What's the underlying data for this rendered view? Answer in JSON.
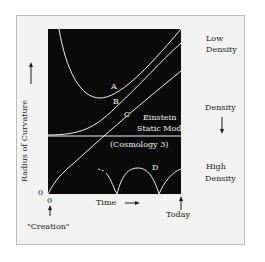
{
  "diagram": {
    "y_axis_label": "Radius of Curvature",
    "y_axis_arrow": "↑",
    "y_origin": "0",
    "x_origin": "0",
    "x_axis_label": "Time",
    "x_axis_arrow": "→",
    "creation_label": "\"Creation\"",
    "today_label": "Today",
    "right_labels": {
      "low_density": [
        "Low",
        "Density"
      ],
      "density": "Density",
      "high_density": [
        "High",
        "Density"
      ]
    },
    "curve_labels": {
      "A": "A",
      "B": "B",
      "C": "C",
      "D": "D"
    },
    "static_model": {
      "line1": "Einstein",
      "line2": "Static Model",
      "line3": "(Cosmology 3)"
    },
    "colors": {
      "plot_background": "#0a0a0a",
      "curve": "#f0f0f0",
      "frame_background": "#f2f2f2",
      "text": "#1a1a1a"
    }
  }
}
